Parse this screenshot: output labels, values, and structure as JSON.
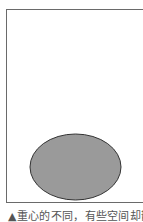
{
  "figure": {
    "shape": "ellipse",
    "colors": {
      "frame_border": "#6a6a6a",
      "ellipse_fill": "#9a9a9a",
      "ellipse_stroke": "#333333",
      "background": "#ffffff"
    }
  },
  "caption": {
    "text": "▲重心的不同，有些空间却散"
  }
}
